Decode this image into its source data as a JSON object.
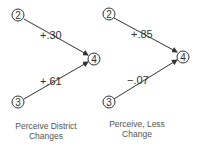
{
  "panels": [
    {
      "id": "left",
      "nodes": {
        "top": "2",
        "right": "4",
        "bottom": "3"
      },
      "paths": [
        {
          "from": "2",
          "to": "4",
          "coefficient": "+.30"
        },
        {
          "from": "3",
          "to": "4",
          "coefficient": "+.61"
        }
      ],
      "caption_line1": "Perceive District",
      "caption_line2": "Changes"
    },
    {
      "id": "right",
      "nodes": {
        "top": "2",
        "right": "4",
        "bottom": "3"
      },
      "paths": [
        {
          "from": "2",
          "to": "4",
          "coefficient": "+.85"
        },
        {
          "from": "3",
          "to": "4",
          "coefficient": "−.07"
        }
      ],
      "caption_line1": "Perceive, Less",
      "caption_line2": "Change"
    }
  ],
  "colors": {
    "line": "#333333",
    "text": "#333333",
    "caption": "#555555"
  }
}
